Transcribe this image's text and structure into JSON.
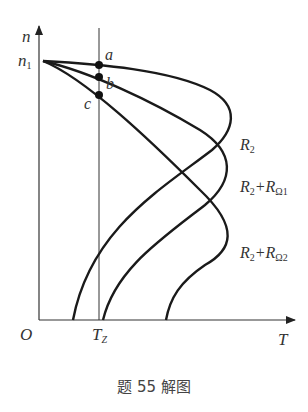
{
  "figure": {
    "caption": "题 55 解图",
    "axes": {
      "y_label": "n",
      "x_label": "T",
      "origin_label": "O",
      "y_tick_label": "n",
      "y_tick_sub": "1",
      "x_tick_label": "T",
      "x_tick_sub": "Z"
    },
    "points": [
      {
        "label": "a"
      },
      {
        "label": "b"
      },
      {
        "label": "c"
      }
    ],
    "curves": [
      {
        "label_main": "R",
        "label_sub": "2",
        "label_suffix": ""
      },
      {
        "label_main": "R",
        "label_sub": "2",
        "label_plus": "+R",
        "label_sub2": "Ω1"
      },
      {
        "label_main": "R",
        "label_sub": "2",
        "label_plus": "+R",
        "label_sub2": "Ω2"
      }
    ],
    "stroke_color": "#1a1a1a"
  }
}
